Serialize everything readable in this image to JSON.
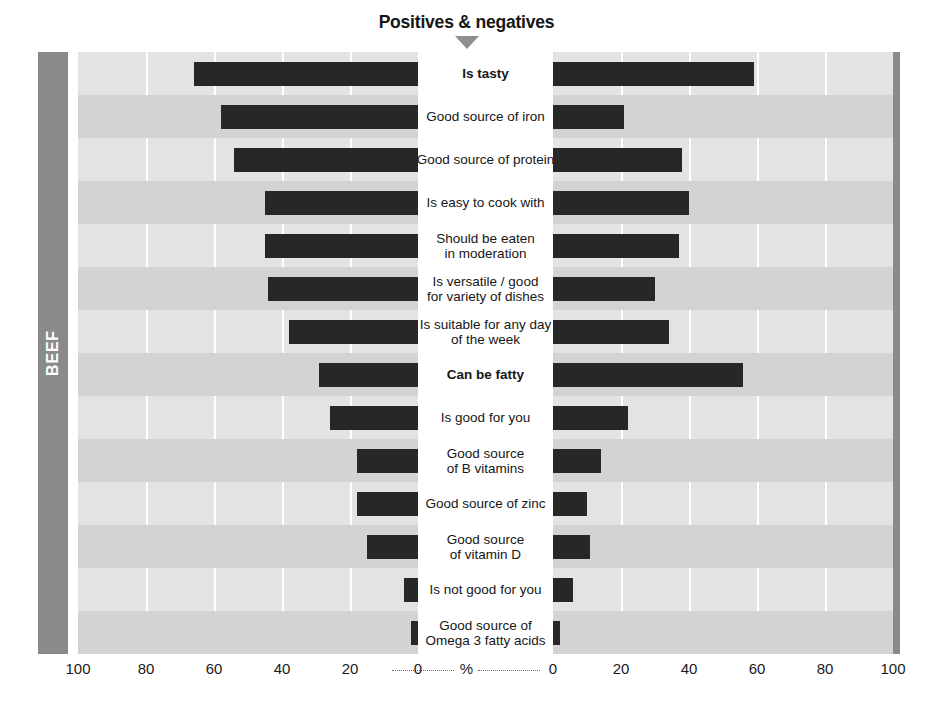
{
  "header": {
    "title": "Positives & negatives",
    "arrow_icon": "triangle-down-icon"
  },
  "sides": {
    "left_label": "BEEF",
    "right_label": "LAMB"
  },
  "footnote": "Total sample n = 500",
  "axis": {
    "unit_label": "%",
    "left_ticks": [
      "100",
      "80",
      "60",
      "40",
      "20",
      "0"
    ],
    "right_ticks": [
      "0",
      "20",
      "40",
      "60",
      "80",
      "100"
    ]
  },
  "chart_data": {
    "type": "bar",
    "title": "Positives & negatives",
    "subtitle": "",
    "orientation": "horizontal-diverging",
    "xlabel": "%",
    "ylabel": "",
    "xlim": [
      0,
      100
    ],
    "grid": true,
    "legend_position": "side-bands",
    "annotations": [
      "Total sample n = 500"
    ],
    "categories": [
      "Is tasty",
      "Good source of iron",
      "Good source of protein",
      "Is easy to cook with",
      "Should be eaten in moderation",
      "Is versatile / good for variety of dishes",
      "Is suitable for any day of the week",
      "Can be fatty",
      "Is good for you",
      "Good source of B vitamins",
      "Good source of zinc",
      "Good source of vitamin D",
      "Is not good for you",
      "Good source of Omega 3 fatty acids"
    ],
    "category_lines": [
      [
        "Is tasty"
      ],
      [
        "Good source of iron"
      ],
      [
        "Good source of protein"
      ],
      [
        "Is easy to cook with"
      ],
      [
        "Should be eaten",
        "in moderation"
      ],
      [
        "Is versatile / good",
        "for variety of dishes"
      ],
      [
        "Is suitable for any day",
        "of the week"
      ],
      [
        "Can be fatty"
      ],
      [
        "Is good for you"
      ],
      [
        "Good source",
        "of B vitamins"
      ],
      [
        "Good source of zinc"
      ],
      [
        "Good source",
        "of vitamin D"
      ],
      [
        "Is not good for you"
      ],
      [
        "Good source of",
        "Omega 3 fatty acids"
      ]
    ],
    "category_bold": [
      true,
      false,
      false,
      false,
      false,
      false,
      false,
      true,
      false,
      false,
      false,
      false,
      false,
      false
    ],
    "series": [
      {
        "name": "BEEF",
        "side": "left",
        "values": [
          66,
          58,
          54,
          45,
          45,
          44,
          38,
          29,
          26,
          18,
          18,
          15,
          4,
          2
        ]
      },
      {
        "name": "LAMB",
        "side": "right",
        "values": [
          59,
          21,
          38,
          40,
          37,
          30,
          34,
          56,
          22,
          14,
          10,
          11,
          6,
          2
        ]
      }
    ],
    "colors": {
      "bar": "#272727",
      "panel_band_light": "#e3e3e3",
      "panel_band_dark": "#d3d3d3",
      "side_band": "#8a8a8a",
      "gridline": "#ffffff"
    }
  }
}
